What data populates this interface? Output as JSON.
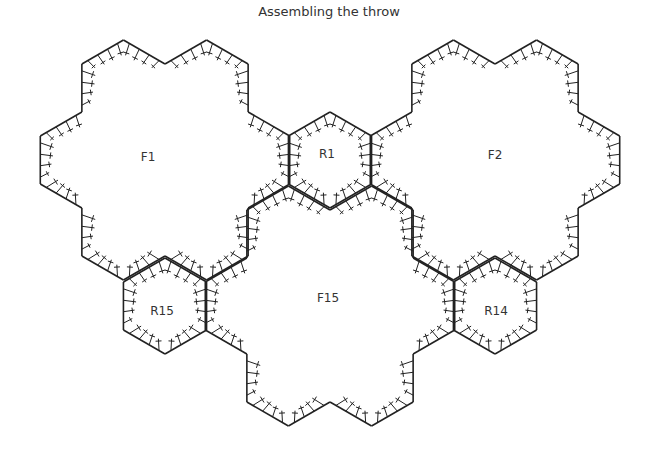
{
  "title": "Assembling the throw",
  "diagram": {
    "hex_side": 48,
    "stroke_color": "#222222",
    "background": "#ffffff",
    "motifs": [
      {
        "id": "F1",
        "label": "F1",
        "type": "flower",
        "center": [
          165,
          160
        ],
        "label_pos": [
          148,
          157
        ]
      },
      {
        "id": "R1",
        "label": "R1",
        "type": "round",
        "center": [
          330,
          160
        ],
        "label_pos": [
          327,
          154
        ]
      },
      {
        "id": "F2",
        "label": "F2",
        "type": "flower",
        "center": [
          495,
          160
        ],
        "label_pos": [
          495,
          155
        ]
      },
      {
        "id": "R15",
        "label": "R15",
        "type": "round",
        "center": [
          165,
          306
        ],
        "label_pos": [
          162,
          311
        ]
      },
      {
        "id": "F15",
        "label": "F15",
        "type": "flower",
        "center": [
          330,
          306
        ],
        "label_pos": [
          328,
          298
        ]
      },
      {
        "id": "R14",
        "label": "R14",
        "type": "round",
        "center": [
          495,
          306
        ],
        "label_pos": [
          496,
          311
        ]
      }
    ]
  }
}
